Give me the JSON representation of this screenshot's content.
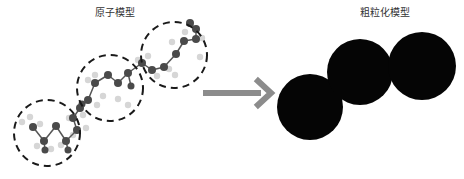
{
  "titles": {
    "atomistic": "原子模型",
    "coarse_grained": "粗粒化模型"
  },
  "colors": {
    "heavy_atom": "#4a4a4a",
    "hydrogen": "#d6d6d6",
    "bond": "#555555",
    "dashed_circle": "#1a1a1a",
    "arrow": "#8c8c8c",
    "bead": "#050505"
  },
  "diagram": {
    "atomistic_groups": 3,
    "coarse_grained_beads": 3,
    "mapping": "each dashed group of atoms → one coarse-grained bead",
    "arrow": "right-arrow"
  }
}
